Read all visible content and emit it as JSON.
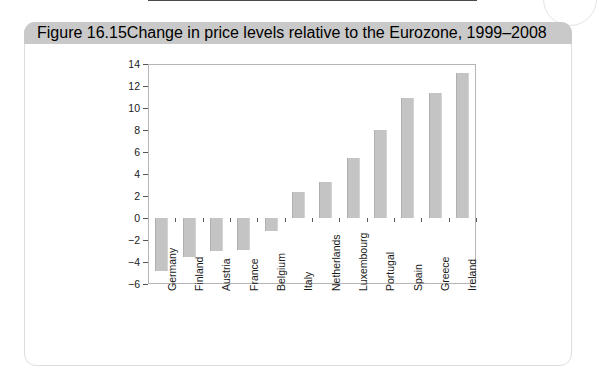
{
  "figure": {
    "number": "Figure 16.15",
    "title": "Change in price levels relative to the Eurozone, 1999–2008"
  },
  "colors": {
    "caption_bar": "#c9c9c9",
    "bar_fill": "#c4c4c4",
    "axis": "#4a4a4a",
    "card_border": "#dedede",
    "page_background": "#ffffff"
  },
  "chart_data": {
    "type": "bar",
    "title": "Change in price levels relative to the Eurozone, 1999–2008",
    "xlabel": "",
    "ylabel": "",
    "ylim": [
      -6,
      14
    ],
    "yticks": [
      14,
      12,
      10,
      8,
      6,
      4,
      2,
      0,
      -2,
      -4,
      -6
    ],
    "ytick_labels": [
      "14",
      "12",
      "10",
      "8",
      "6",
      "4",
      "2",
      "0",
      "−2",
      "−4",
      "−6"
    ],
    "grid": false,
    "legend": null,
    "orientation": "vertical",
    "categories": [
      "Germany",
      "Finland",
      "Austria",
      "France",
      "Belgium",
      "Italy",
      "Netherlands",
      "Luxembourg",
      "Portugal",
      "Spain",
      "Greece",
      "Ireland"
    ],
    "values": [
      -4.8,
      -3.5,
      -3.0,
      -2.9,
      -1.2,
      2.4,
      3.3,
      5.5,
      8.0,
      10.9,
      11.4,
      13.2
    ]
  }
}
